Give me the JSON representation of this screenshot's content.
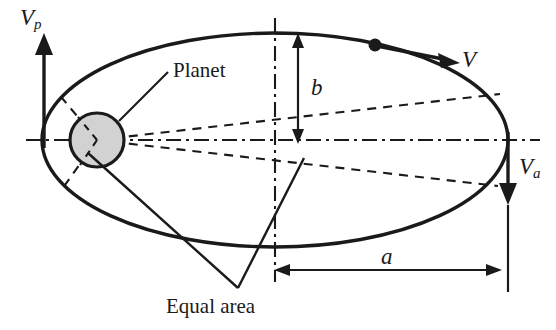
{
  "figure": {
    "background_color": "#ffffff",
    "line_color": "#1a1a1a",
    "planet_fill_color": "#d2d2d2"
  },
  "labels": {
    "perihelion_velocity": {
      "symbol": "V",
      "subscript": "p"
    },
    "aphelion_velocity": {
      "symbol": "V",
      "subscript": "a"
    },
    "orbital_velocity": {
      "symbol": "V",
      "subscript": ""
    },
    "semi_minor_axis": {
      "symbol": "b",
      "subscript": ""
    },
    "semi_major_axis": {
      "symbol": "a",
      "subscript": ""
    },
    "planet": "Planet",
    "equal_area": "Equal area"
  },
  "geometry": {
    "ellipse": {
      "cx": 275,
      "cy": 140,
      "rx": 233,
      "ry": 107
    },
    "planet_circle": {
      "cx": 97,
      "cy": 140,
      "r": 27
    },
    "orbit_point": {
      "cx": 375,
      "cy": 45,
      "r": 6
    },
    "major_axis_y": 140,
    "minor_axis_x": 275,
    "dimension_a": {
      "x1": 275,
      "x2": 498,
      "y": 270
    },
    "dimension_b": {
      "x": 298,
      "y1": 36,
      "y2": 140
    }
  }
}
